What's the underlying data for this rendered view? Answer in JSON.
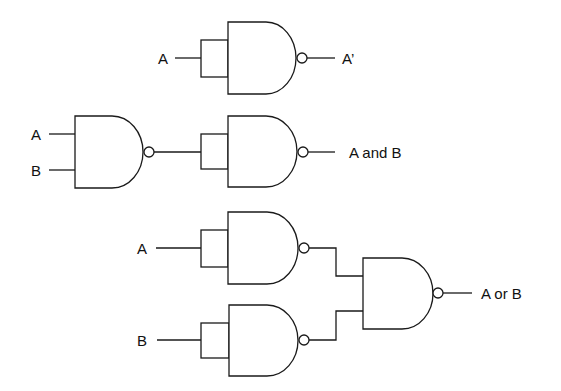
{
  "diagram": {
    "stroke_color": "#1a1a1a",
    "circuits": [
      {
        "name": "not",
        "inputs": [
          "A"
        ],
        "output": "A'",
        "gates": [
          "NAND (inputs tied)"
        ]
      },
      {
        "name": "and",
        "inputs": [
          "A",
          "B"
        ],
        "output": "A and B",
        "gates": [
          "NAND",
          "NAND (inputs tied)"
        ]
      },
      {
        "name": "or",
        "inputs": [
          "A",
          "B"
        ],
        "output": "A or B",
        "gates": [
          "NAND (inputs tied)",
          "NAND (inputs tied)",
          "NAND"
        ]
      }
    ]
  },
  "labels": {
    "not_in_a": "A",
    "not_out": "A’",
    "and_in_a": "A",
    "and_in_b": "B",
    "and_out": "A and B",
    "or_in_a": "A",
    "or_in_b": "B",
    "or_out": "A or B"
  }
}
